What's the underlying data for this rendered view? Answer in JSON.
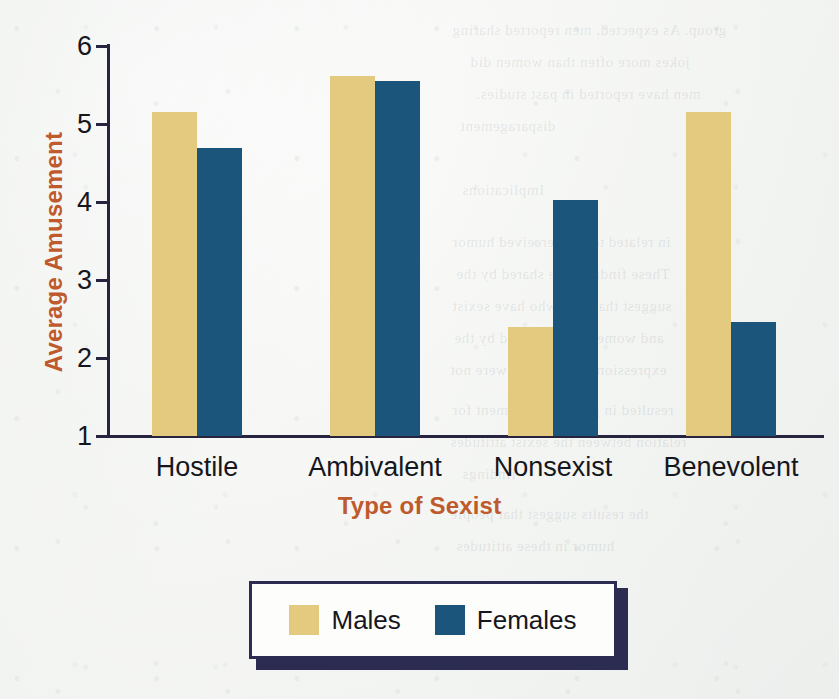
{
  "chart_data": {
    "type": "bar",
    "title": "",
    "xlabel": "Type of Sexist",
    "ylabel": "Average Amusement",
    "categories": [
      "Hostile",
      "Ambivalent",
      "Nonsexist",
      "Benevolent"
    ],
    "series": [
      {
        "name": "Males",
        "color": "#e3ca7f",
        "values": [
          5.15,
          5.62,
          2.4,
          5.15
        ]
      },
      {
        "name": "Females",
        "color": "#1c557b",
        "values": [
          4.69,
          5.55,
          4.03,
          2.46
        ]
      }
    ],
    "ylim": [
      1,
      6
    ],
    "yticks": [
      1,
      2,
      3,
      4,
      5,
      6
    ],
    "ytick_labels": [
      "1",
      "2",
      "3",
      "4",
      "5",
      "6"
    ],
    "grid": false,
    "legend_position": "bottom-center",
    "axis_color": "#26243f",
    "axis_label_color": "#bf5a2c",
    "tick_label_color": "#16161d",
    "legend_border_color": "#2c2c52",
    "background_color": "#f4f5f2"
  },
  "ghost_text": [
    {
      "text": "group. As expected, men reported sharing",
      "x": 452,
      "y": 22
    },
    {
      "text": "jokes more often than women did",
      "x": 470,
      "y": 54
    },
    {
      "text": "men have reported in past studies.",
      "x": 476,
      "y": 86
    },
    {
      "text": "disparagement",
      "x": 460,
      "y": 118
    },
    {
      "text": "Implications",
      "x": 462,
      "y": 182
    },
    {
      "text": "in related to the perceived humor",
      "x": 452,
      "y": 234
    },
    {
      "text": "These findings are shared by the",
      "x": 456,
      "y": 266
    },
    {
      "text": "suggest that men who have sexist",
      "x": 452,
      "y": 298
    },
    {
      "text": "and women were amused by the",
      "x": 454,
      "y": 330
    },
    {
      "text": "expressions of attitudes were not",
      "x": 450,
      "y": 362
    },
    {
      "text": "resulted in greater amusement for",
      "x": 452,
      "y": 402
    },
    {
      "text": "relation between the sexist attitudes",
      "x": 450,
      "y": 434
    },
    {
      "text": "findings",
      "x": 462,
      "y": 466
    },
    {
      "text": "the results suggest that people",
      "x": 450,
      "y": 506
    },
    {
      "text": "humor in these attitudes",
      "x": 456,
      "y": 538
    }
  ]
}
